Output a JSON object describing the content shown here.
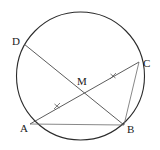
{
  "figure": {
    "colors": {
      "circle_stroke": "#2b2b2b",
      "chord_stroke": "#4a4a4a",
      "label_color": "#1a1a1a",
      "background": "#ffffff"
    },
    "circle": {
      "center_x": 80.5,
      "center_y": 76,
      "radius": 64
    },
    "points": [
      {
        "id": "D",
        "label": "D",
        "x": 24,
        "y": 44,
        "label_x": 12,
        "label_y": 45
      },
      {
        "id": "C",
        "label": "C",
        "x": 139,
        "y": 62,
        "label_x": 143,
        "label_y": 67
      },
      {
        "id": "M",
        "label": "M",
        "x": 84,
        "y": 88,
        "label_x": 77,
        "label_y": 85
      },
      {
        "id": "A",
        "label": "A",
        "x": 30,
        "y": 124,
        "label_x": 20,
        "label_y": 132
      },
      {
        "id": "B",
        "label": "B",
        "x": 124,
        "y": 125,
        "label_x": 127,
        "label_y": 133
      }
    ],
    "segments": [
      {
        "id": "DB",
        "from": "D",
        "to": "B",
        "x1": 24,
        "y1": 44,
        "x2": 124,
        "y2": 125
      },
      {
        "id": "AC",
        "from": "A",
        "to": "C",
        "x1": 30,
        "y1": 124,
        "x2": 139,
        "y2": 62
      },
      {
        "id": "AB",
        "from": "A",
        "to": "B",
        "x1": 30,
        "y1": 124,
        "x2": 124,
        "y2": 125
      },
      {
        "id": "CB",
        "from": "C",
        "to": "B",
        "x1": 139,
        "y1": 62,
        "x2": 124,
        "y2": 125
      }
    ],
    "tick_marks": [
      {
        "id": "tick-AM",
        "on_segment": "AM",
        "x": 57,
        "y": 106,
        "angle": -30
      },
      {
        "id": "tick-MC",
        "on_segment": "MC",
        "x": 113,
        "y": 76,
        "angle": -30
      }
    ]
  }
}
